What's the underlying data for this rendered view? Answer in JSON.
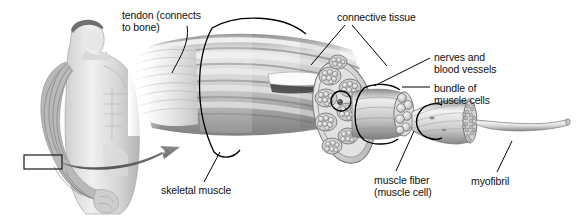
{
  "figure": {
    "width": 582,
    "height": 218,
    "background_color": "#ffffff",
    "text_color": "#101010",
    "line_color": "#000000",
    "arrow_color": "#6e6e6e"
  },
  "labels": [
    {
      "id": "tendon",
      "text": "tendon (connects\nto bone)",
      "x": 122,
      "y": 9,
      "leader": {
        "x1": 187,
        "y1": 26,
        "x2": 172,
        "y2": 73
      }
    },
    {
      "id": "connective-tissue",
      "text": "connective tissue",
      "x": 337,
      "y": 11,
      "leader_left": {
        "x1": 345,
        "y1": 25,
        "x2": 311,
        "y2": 65
      },
      "leader_right": {
        "x1": 352,
        "y1": 25,
        "x2": 387,
        "y2": 66
      }
    },
    {
      "id": "nerves-and-blood-vessels",
      "text": "nerves and\nblood vessels",
      "x": 434,
      "y": 51,
      "leader": {
        "x1": 430,
        "y1": 58,
        "x2": 374,
        "y2": 86
      }
    },
    {
      "id": "bundle-of-muscle-cells",
      "text": "bundle of\nmuscle cells",
      "x": 434,
      "y": 82,
      "leader": {
        "x1": 430,
        "y1": 87,
        "x2": 402,
        "y2": 87
      }
    },
    {
      "id": "myofibril",
      "text": "myofibril",
      "x": 471,
      "y": 175,
      "leader": {
        "x1": 497,
        "y1": 172,
        "x2": 512,
        "y2": 141
      }
    },
    {
      "id": "muscle-fiber",
      "text": "muscle fiber\n(muscle cell)",
      "x": 374,
      "y": 174,
      "leader": {
        "x1": 396,
        "y1": 171,
        "x2": 414,
        "y2": 131
      }
    },
    {
      "id": "skeletal-muscle",
      "text": "skeletal muscle",
      "x": 161,
      "y": 184,
      "leader": {
        "x1": 204,
        "y1": 182,
        "x2": 220,
        "y2": 152
      }
    }
  ],
  "anatomy": {
    "human_figure": {
      "name": "male-torso-with-arm-musculature",
      "highlight_box": {
        "x": 24,
        "y": 155,
        "width": 38,
        "height": 14
      }
    },
    "magnify_arrow": {
      "name": "magnification-arrow",
      "from": {
        "x": 62,
        "y": 163
      },
      "to": {
        "x": 178,
        "y": 147
      }
    },
    "muscle_belly": {
      "name": "skeletal-muscle-belly",
      "fascicle_count": 9
    },
    "cut_face": {
      "name": "muscle-cross-section",
      "fascicle_cross_sections": 9,
      "cells_per_fascicle": 7
    },
    "fascicle": {
      "name": "bundle-of-muscle-cells-detail",
      "fiber_cross_sections": 7
    },
    "muscle_fiber": {
      "name": "muscle-fiber-detail",
      "myofibril_cross_sections": 19
    },
    "myofibril": {
      "name": "single-myofibril-strand"
    }
  }
}
